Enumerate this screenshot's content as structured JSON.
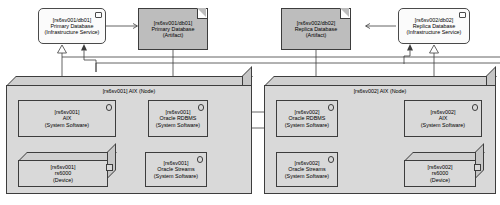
{
  "diagram": {
    "type": "deployment-diagram"
  },
  "top_nodes": [
    {
      "id": "primary-db-service",
      "line1": "[rs6sv001/db01]",
      "line2": "Primary Database",
      "line3": "(Infrastructure Service)",
      "kind": "infrastructure-service",
      "fill": "#fbfbfb"
    },
    {
      "id": "primary-db-artifact",
      "line1": "[rs6sv001/db01]",
      "line2": "Primary Database",
      "line3": "(Artifact)",
      "kind": "artifact",
      "fill": "#bdbdbd"
    },
    {
      "id": "replica-db-artifact",
      "line1": "[rs6sv002/db02]",
      "line2": "Replica Database",
      "line3": "(Artifact)",
      "kind": "artifact",
      "fill": "#bdbdbd"
    },
    {
      "id": "replica-db-service",
      "line1": "[rs6sv002/db02]",
      "line2": "Replica Database",
      "line3": "(Infrastructure Service)",
      "kind": "infrastructure-service",
      "fill": "#fbfbfb"
    }
  ],
  "containers": [
    {
      "id": "node-rs6sv001",
      "title": "[rs6sv001] AIX (Node)",
      "kind": "node",
      "fill": "#d9d9d9",
      "components": [
        {
          "id": "aix-001",
          "line1": "[rs6sv001]",
          "line2": "AIX",
          "line3": "(System Software)",
          "kind": "system-software"
        },
        {
          "id": "oracle-rdbms-001",
          "line1": "[rs6sv001]",
          "line2": "Oracle RDBMS",
          "line3": "(System Software)",
          "kind": "system-software"
        },
        {
          "id": "rs6000-001",
          "line1": "[rs6sv001]",
          "line2": "rs6000",
          "line3": "(Device)",
          "kind": "device"
        },
        {
          "id": "oracle-streams-001",
          "line1": "[rs6sv001]",
          "line2": "Oracle Streams",
          "line3": "(System Software)",
          "kind": "system-software"
        }
      ]
    },
    {
      "id": "node-rs6sv002",
      "title": "[rs6sv002] AIX (Node)",
      "kind": "node",
      "fill": "#d9d9d9",
      "components": [
        {
          "id": "oracle-rdbms-002",
          "line1": "[rs6sv002]",
          "line2": "Oracle RDBMS",
          "line3": "(System Software)",
          "kind": "system-software"
        },
        {
          "id": "aix-002",
          "line1": "[rs6sv002]",
          "line2": "AIX",
          "line3": "(System Software)",
          "kind": "system-software"
        },
        {
          "id": "oracle-streams-002",
          "line1": "[rs6sv002]",
          "line2": "Oracle Streams",
          "line3": "(System Software)",
          "kind": "system-software"
        },
        {
          "id": "rs6000-002",
          "line1": "[rs6sv002]",
          "line2": "rs6000",
          "line3": "(Device)",
          "kind": "device"
        }
      ]
    }
  ],
  "colors": {
    "artifact_fill": "#bdbdbd",
    "service_fill": "#fbfbfb",
    "node_fill": "#d9d9d9",
    "node_top": "#cfcfcf",
    "node_side": "#c6c6c6",
    "stroke": "#3d3d3d",
    "background": "#ffffff"
  }
}
